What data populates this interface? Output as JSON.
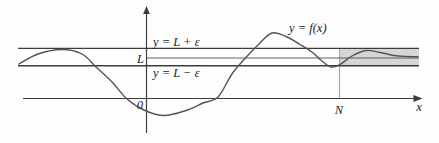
{
  "figure": {
    "labels": {
      "upper_epsilon_line": "y = L + ε",
      "limit_value": "L",
      "lower_epsilon_line": "y = L − ε",
      "function": "y = f(x)",
      "origin": "0",
      "n_marker": "N",
      "x_axis": "x"
    },
    "colors": {
      "background": "#fdfdfd",
      "band_fill": "#d5d5d5",
      "line": "#3c3c3c",
      "curve": "#555555",
      "n_line": "#a8a8a8",
      "text": "#1c1c1c"
    },
    "curve_points": [
      [
        19,
        64
      ],
      [
        38,
        54
      ],
      [
        62,
        49.5
      ],
      [
        82,
        54
      ],
      [
        96,
        67
      ],
      [
        112,
        82
      ],
      [
        127,
        99
      ],
      [
        145,
        110.5
      ],
      [
        164,
        115.5
      ],
      [
        186,
        110.5
      ],
      [
        203,
        103
      ],
      [
        218,
        97
      ],
      [
        232,
        74
      ],
      [
        245,
        58.5
      ],
      [
        258,
        45
      ],
      [
        272,
        33
      ],
      [
        287,
        37
      ],
      [
        300,
        44.5
      ],
      [
        312,
        52
      ],
      [
        322,
        61
      ],
      [
        331,
        67
      ],
      [
        340,
        64.5
      ],
      [
        352,
        56
      ],
      [
        366,
        50.5
      ],
      [
        380,
        52.5
      ],
      [
        394,
        55.5
      ],
      [
        406,
        56.5
      ],
      [
        418,
        56.8
      ]
    ]
  }
}
